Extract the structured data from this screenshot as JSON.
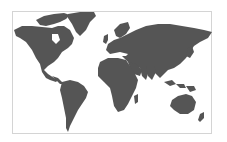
{
  "map": {
    "type": "world-map-silhouette",
    "projection": "equirectangular-like",
    "land_color": "#555555",
    "water_color": "#ffffff",
    "border_color": "#d4d4d4",
    "regions": [
      "North America",
      "Greenland",
      "South America",
      "Europe",
      "Africa",
      "Asia",
      "Australia",
      "New Zealand",
      "Southeast Asia Islands",
      "Japan",
      "United Kingdom",
      "Madagascar",
      "Antarctic-excluded"
    ]
  }
}
